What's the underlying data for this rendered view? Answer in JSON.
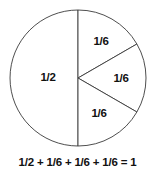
{
  "figure": {
    "name": "fraction-pie-chart",
    "caption": "1/2 + 1/6 + 1/6 + 1/6 = 1",
    "stroke_color": "#3a3a3a",
    "fill_color": "#ffffff",
    "text_color": "#111111"
  },
  "chart_data": {
    "type": "pie",
    "title": "",
    "subtitle": "",
    "xlabel": "",
    "ylabel": "",
    "legend": "none",
    "grid": false,
    "total_label": "1",
    "center": {
      "x": 78,
      "y": 78
    },
    "radius": 68,
    "categories": [
      "1/2",
      "1/6",
      "1/6",
      "1/6"
    ],
    "values": [
      0.5,
      0.16667,
      0.16667,
      0.16667
    ],
    "degrees": [
      180,
      60,
      60,
      60
    ],
    "slices": [
      {
        "label": "1/2",
        "value": 0.5,
        "degrees": 180,
        "start_deg": 90,
        "end_deg": 270,
        "label_x": 48,
        "label_y": 78
      },
      {
        "label": "1/6",
        "value": 0.16667,
        "degrees": 60,
        "start_deg": 30,
        "end_deg": 90,
        "label_x": 101,
        "label_y": 42
      },
      {
        "label": "1/6",
        "value": 0.16667,
        "degrees": 60,
        "start_deg": -30,
        "end_deg": 30,
        "label_x": 121,
        "label_y": 79
      },
      {
        "label": "1/6",
        "value": 0.16667,
        "degrees": 60,
        "start_deg": -90,
        "end_deg": -30,
        "label_x": 99,
        "label_y": 114
      }
    ]
  }
}
